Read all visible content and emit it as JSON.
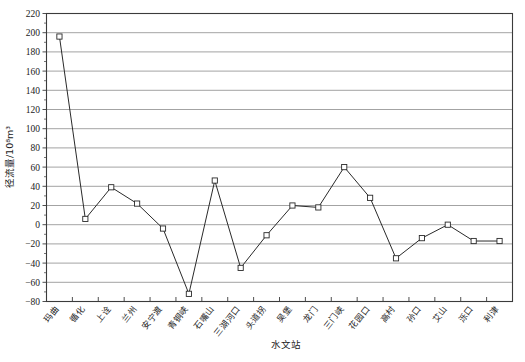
{
  "chart_data": {
    "type": "line",
    "title": "",
    "xlabel": "水文站",
    "ylabel": "径流量/10⁸m³",
    "ylim": [
      -80,
      220
    ],
    "ytick_step": 20,
    "grid": true,
    "legend": "none",
    "marker": "open-square",
    "line_color": "#2a2a2a",
    "grid_color": "#8c8c8c",
    "axis_color": "#3b3b3b",
    "categories": [
      "玛曲",
      "循化",
      "上诠",
      "兰州",
      "安宁渡",
      "青铜峡",
      "石嘴山",
      "三湖河口",
      "头道拐",
      "吴堡",
      "龙门",
      "三门峡",
      "花园口",
      "高村",
      "孙口",
      "艾山",
      "泺口",
      "利津"
    ],
    "values": [
      196,
      6,
      39,
      22,
      -4,
      -72,
      46,
      -45,
      -11,
      20,
      18,
      60,
      28,
      -35,
      -14,
      0,
      -17,
      -17
    ],
    "ytick_labels": [
      "220",
      "200",
      "180",
      "160",
      "140",
      "120",
      "100",
      "80",
      "60",
      "40",
      "20",
      "0",
      "-20",
      "-40",
      "-60",
      "-80"
    ]
  }
}
